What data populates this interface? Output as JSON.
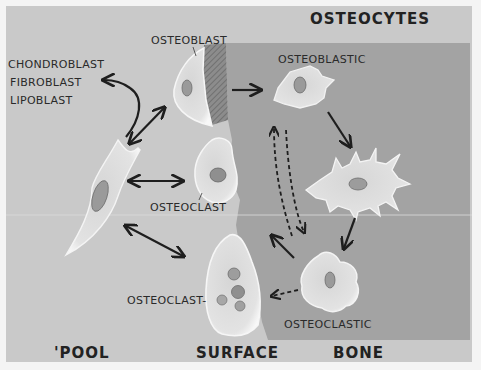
{
  "diagram": {
    "colors": {
      "background": "#c9c9c9",
      "bone": "#a3a3a3",
      "cell_fill": "#dedede",
      "cell_edge": "#f6f6f6",
      "nucleus": "#8e8e8e",
      "arrow": "#1e1e1e",
      "text": "#2a2a2a"
    },
    "region_labels": {
      "pool": "'POOL",
      "surface": "SURFACE",
      "bone": "BONE",
      "osteocytes": "OSTEOCYTES"
    },
    "cell_labels": {
      "osteoblast": "OSTEOBLAST",
      "osteoclast_top": "OSTEOCLAST",
      "osteoclast_bottom": "OSTEOCLAST-",
      "osteoblastic": "OSTEOBLASTIC",
      "osteoclastic": "OSTEOCLASTIC"
    },
    "progenitor_labels": [
      "CHONDROBLAST",
      "FIBROBLAST",
      "LIPOBLAST"
    ],
    "arrows": [
      {
        "from": "progenitor",
        "to": "chondroblast/fibroblast/lipoblast",
        "style": "solid",
        "direction": "one-way"
      },
      {
        "from": "progenitor",
        "to": "osteoblast",
        "style": "solid",
        "direction": "two-way"
      },
      {
        "from": "progenitor",
        "to": "osteoclast (small)",
        "style": "solid",
        "direction": "two-way"
      },
      {
        "from": "progenitor",
        "to": "osteoclast (multinucleated)",
        "style": "solid",
        "direction": "two-way"
      },
      {
        "from": "osteoblast",
        "to": "osteoblastic osteocyte",
        "style": "solid",
        "direction": "one-way"
      },
      {
        "from": "osteoblastic osteocyte",
        "to": "mature osteocyte",
        "style": "solid",
        "direction": "one-way"
      },
      {
        "from": "mature osteocyte",
        "to": "osteoclastic osteocyte",
        "style": "solid",
        "direction": "one-way"
      },
      {
        "from": "osteoclastic osteocyte",
        "to": "surface",
        "style": "solid",
        "direction": "one-way"
      },
      {
        "from": "osteoclastic osteocyte",
        "to": "osteoclast (multinucleated)",
        "style": "dashed",
        "direction": "one-way"
      },
      {
        "from": "surface",
        "to": "osteoblastic osteocyte",
        "style": "dashed",
        "direction": "one-way"
      },
      {
        "from": "osteoblastic osteocyte",
        "to": "surface",
        "style": "dashed",
        "direction": "one-way"
      }
    ]
  }
}
